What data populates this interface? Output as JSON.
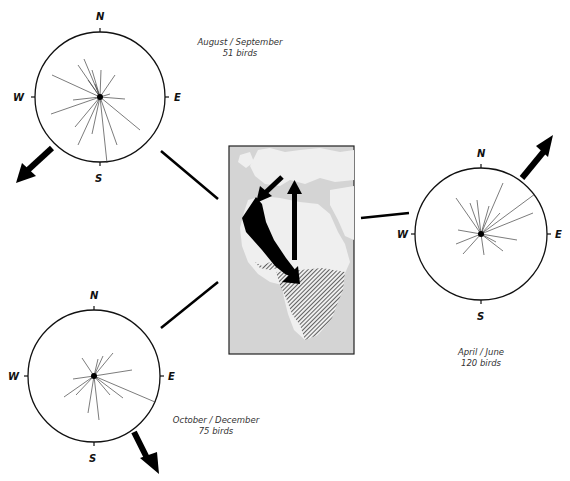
{
  "compasses": [
    {
      "id": "aug-sep",
      "period": "August / September",
      "count_label": "51 birds",
      "directions": {
        "n": "N",
        "e": "E",
        "s": "S",
        "w": "W"
      },
      "mean_direction": "SW"
    },
    {
      "id": "oct-dec",
      "period": "October / December",
      "count_label": "75 birds",
      "directions": {
        "n": "N",
        "e": "E",
        "s": "S",
        "w": "W"
      },
      "mean_direction": "SSE"
    },
    {
      "id": "apr-jun",
      "period": "April / June",
      "count_label": "120 birds",
      "directions": {
        "n": "N",
        "e": "E",
        "s": "S",
        "w": "W"
      },
      "mean_direction": "NE"
    }
  ],
  "map": {
    "description": "Europe and Africa migration route map",
    "colors": {
      "sea": "#d4d4d4",
      "land": "#efefef",
      "route": "#000000",
      "wintering_hatch": "#333333"
    }
  }
}
